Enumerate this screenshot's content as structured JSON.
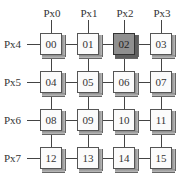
{
  "diagram": {
    "type": "mesh-network",
    "column_labels": [
      "Px0",
      "Px1",
      "Px2",
      "Px3"
    ],
    "row_labels": [
      "Px4",
      "Px5",
      "Px6",
      "Px7"
    ],
    "nodes": [
      [
        "00",
        "01",
        "02",
        "03"
      ],
      [
        "04",
        "05",
        "06",
        "07"
      ],
      [
        "08",
        "09",
        "10",
        "11"
      ],
      [
        "12",
        "13",
        "14",
        "15"
      ]
    ],
    "highlighted_node": "02",
    "colors": {
      "node_face": "#fbfbfb",
      "highlighted_face": "#8f8f8f",
      "line": "#444444",
      "text": "#333333"
    }
  }
}
